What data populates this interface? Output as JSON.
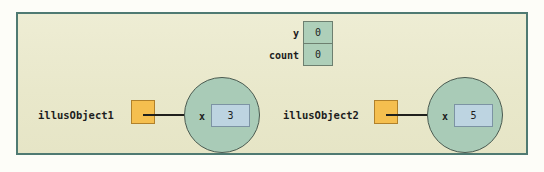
{
  "diagram": {
    "title": "",
    "colors": {
      "page_background": "#fdfdf8",
      "panel_background": "#eae9cd",
      "panel_border": "#4f7a72",
      "object_circle_fill": "#a9cbb7",
      "object_circle_border": "#4a5a50",
      "reference_box_fill": "#f5bf4f",
      "reference_box_border": "#b1812a",
      "value_box_fill": "#bdd4e1",
      "value_box_border": "#7c93a3",
      "variable_box_fill": "#aecfb9",
      "variable_box_border": "#6d7f6f",
      "arrow": "#20201c",
      "text": "#1d1d1d"
    },
    "variables": [
      {
        "name": "y",
        "value": "0"
      },
      {
        "name": "count",
        "value": "0"
      }
    ],
    "objects": [
      {
        "reference_name": "illusObject1",
        "reference_box_value": "",
        "arrow_icon": "arrow-right-icon",
        "field_name": "x",
        "field_value": "3"
      },
      {
        "reference_name": "illusObject2",
        "reference_box_value": "",
        "arrow_icon": "arrow-right-icon",
        "field_name": "x",
        "field_value": "5"
      }
    ]
  }
}
